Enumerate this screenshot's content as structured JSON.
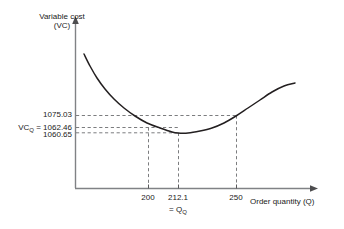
{
  "chart_data": {
    "type": "line",
    "title": "",
    "ylabel": "Variable cost (VC)",
    "xlabel": "Order quantity (Q)",
    "ylabel_line1": "Variable cost",
    "ylabel_line2": "(VC)",
    "xlabel_text": "Order quantity (",
    "xlabel_var": "Q",
    "xlabel_close": ")",
    "grid": false,
    "legend": "none",
    "axis_arrows": true,
    "curve_description": "convex U-shaped variable cost curve with minimum at Q = 212.1",
    "x": [
      200,
      212.1,
      250
    ],
    "y": [
      1062.46,
      1060.65,
      1075.03
    ],
    "annotations": {
      "y_high_value": "1075.03",
      "y_optimum_prefix": "VC",
      "y_optimum_subscript": "Q",
      "y_optimum_eq": "=",
      "y_optimum_value": "1062.46",
      "y_min_value": "1060.65",
      "x_tick_low": "200",
      "x_tick_opt": "212.1",
      "x_tick_high": "250",
      "x_opt_eq": "=",
      "x_opt_symbol": "Q",
      "x_opt_subscript": "Q"
    },
    "series": [
      {
        "name": "Variable cost VC(Q)",
        "points_px": [
          [
            84,
            54
          ],
          [
            90,
            66
          ],
          [
            97,
            78
          ],
          [
            105,
            89
          ],
          [
            114,
            99
          ],
          [
            124,
            108
          ],
          [
            135,
            116
          ],
          [
            147,
            123
          ],
          [
            160,
            128
          ],
          [
            172,
            132
          ],
          [
            178,
            133
          ],
          [
            188,
            133
          ],
          [
            200,
            131
          ],
          [
            212,
            128
          ],
          [
            224,
            123
          ],
          [
            236,
            116
          ],
          [
            248,
            108
          ],
          [
            260,
            100
          ],
          [
            272,
            92
          ],
          [
            284,
            86
          ],
          [
            295,
            83
          ]
        ]
      }
    ],
    "colors": {
      "curve": "#231f20",
      "axis": "#808285",
      "dashed": "#6d6e71",
      "text": "#1a1a1a",
      "background": "#ffffff"
    }
  }
}
